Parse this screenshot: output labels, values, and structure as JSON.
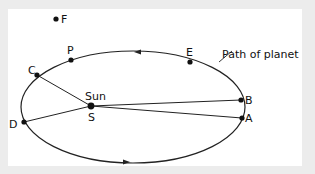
{
  "diagram": {
    "path_label": "Path of planet",
    "sun_label": "Sun",
    "sun_point": "S",
    "points": {
      "F": "F",
      "P": "P",
      "E": "E",
      "C": "C",
      "D": "D",
      "B": "B",
      "A": "A"
    },
    "colors": {
      "background": "#ececec",
      "panel": "#ffffff",
      "line": "#222222"
    }
  }
}
